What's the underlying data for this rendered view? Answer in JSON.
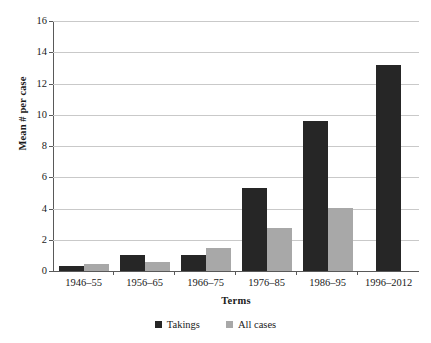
{
  "chart_data": {
    "type": "bar",
    "title": "",
    "xlabel": "Terms",
    "ylabel": "Mean # per case",
    "categories": [
      "1946–55",
      "1956–65",
      "1966–75",
      "1976–85",
      "1986–95",
      "1996–2012"
    ],
    "series": [
      {
        "name": "Takings",
        "color": "#262626",
        "values": [
          0.3,
          1.05,
          1.05,
          5.3,
          9.6,
          13.2
        ]
      },
      {
        "name": "All cases",
        "color": "#a8a8a8",
        "values": [
          0.45,
          0.55,
          1.45,
          2.75,
          4.05,
          0
        ]
      }
    ],
    "ylim": [
      0,
      16
    ],
    "ytick_labels": [
      "0",
      "2",
      "4",
      "6",
      "8",
      "10",
      "12",
      "14",
      "16"
    ],
    "ytick_values": [
      0,
      2,
      4,
      6,
      8,
      10,
      12,
      14,
      16
    ],
    "grid": true,
    "legend_position": "bottom-center",
    "background_color": "#ffffff",
    "gridline_color": "#c9c9c9",
    "axis_color": "#595959"
  }
}
